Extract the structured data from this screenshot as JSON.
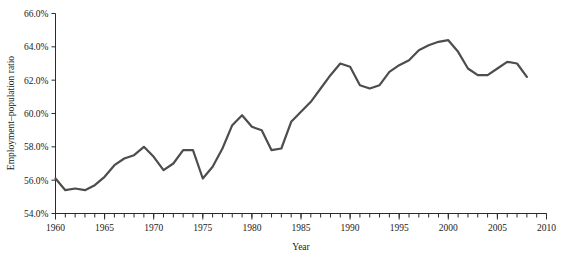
{
  "chart_data": {
    "type": "line",
    "title": "",
    "xlabel": "Year",
    "ylabel": "Employment–population ratio",
    "xlim": [
      1960,
      2010
    ],
    "ylim": [
      54.0,
      66.0
    ],
    "grid": false,
    "legend": null,
    "x_tick_labels": [
      "1960",
      "1965",
      "1970",
      "1975",
      "1980",
      "1985",
      "1990",
      "1995",
      "2000",
      "2005",
      "2010"
    ],
    "x_tick_values": [
      1960,
      1965,
      1970,
      1975,
      1980,
      1985,
      1990,
      1995,
      2000,
      2005,
      2010
    ],
    "x_minor_tick_step": 1,
    "y_tick_labels": [
      "54.0%",
      "56.0%",
      "58.0%",
      "60.0%",
      "62.0%",
      "64.0%",
      "66.0%"
    ],
    "y_tick_values": [
      54.0,
      56.0,
      58.0,
      60.0,
      62.0,
      64.0,
      66.0
    ],
    "series": [
      {
        "name": "Employment–population ratio",
        "color": "#4d4d4d",
        "line_width": 2.2,
        "x": [
          1960,
          1961,
          1962,
          1963,
          1964,
          1965,
          1966,
          1967,
          1968,
          1969,
          1970,
          1971,
          1972,
          1973,
          1974,
          1975,
          1976,
          1977,
          1978,
          1979,
          1980,
          1981,
          1982,
          1983,
          1984,
          1985,
          1986,
          1987,
          1988,
          1989,
          1990,
          1991,
          1992,
          1993,
          1994,
          1995,
          1996,
          1997,
          1998,
          1999,
          2000,
          2001,
          2002,
          2003,
          2004,
          2005,
          2006,
          2007,
          2008
        ],
        "values": [
          56.1,
          55.4,
          55.5,
          55.4,
          55.7,
          56.2,
          56.9,
          57.3,
          57.5,
          58.0,
          57.4,
          56.6,
          57.0,
          57.8,
          57.8,
          56.1,
          56.8,
          57.9,
          59.3,
          59.9,
          59.2,
          59.0,
          57.8,
          57.9,
          59.5,
          60.1,
          60.7,
          61.5,
          62.3,
          63.0,
          62.8,
          61.7,
          61.5,
          61.7,
          62.5,
          62.9,
          63.2,
          63.8,
          64.1,
          64.3,
          64.4,
          63.7,
          62.7,
          62.3,
          62.3,
          62.7,
          63.1,
          63.0,
          62.2
        ]
      }
    ],
    "annotations": []
  },
  "axes": {
    "x_axis_name": "year-axis",
    "y_axis_name": "employment-population-ratio-axis"
  }
}
